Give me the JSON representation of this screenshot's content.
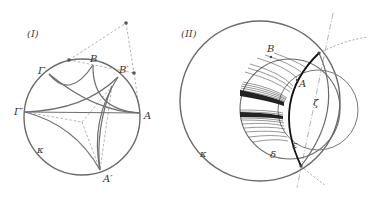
{
  "figures": [
    {
      "id": "I",
      "panel_label": "(I)",
      "labels": {
        "A": "A",
        "A_prime": "A′",
        "B": "B",
        "B_prime": "B′",
        "Gamma": "Γ",
        "Gamma_prime": "Γ′",
        "kappa": "κ"
      }
    },
    {
      "id": "II",
      "panel_label": "(II)",
      "labels": {
        "A": "A",
        "B": "B",
        "delta": "δ",
        "epsilon": "ε",
        "zeta": "ζ",
        "kappa": "κ"
      }
    }
  ],
  "colors": {
    "circle": "#6a6a6a",
    "arc": "#707070",
    "dashed": "#9a9a9a",
    "bold": "#111111",
    "point": "#555555"
  }
}
